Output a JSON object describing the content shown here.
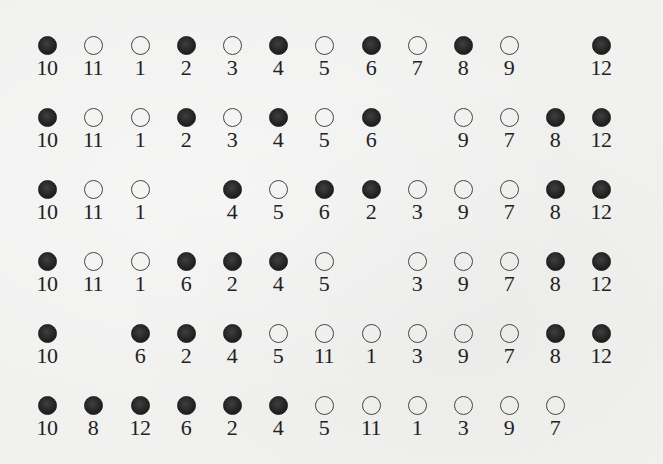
{
  "diagram": {
    "column_positions_px": [
      47,
      93,
      140,
      186,
      232,
      278,
      324,
      371,
      417,
      463,
      509,
      555,
      601
    ],
    "row_positions_px": [
      36,
      108,
      180,
      252,
      324,
      396
    ],
    "legend": {
      "filled": "dark filled circle",
      "open": "hollow circle"
    },
    "colors": {
      "background": "#f1f1f0",
      "filled_circle": "#2a2a2a",
      "open_circle_stroke": "#444444",
      "label_text": "#222222"
    },
    "rows": [
      {
        "items": [
          {
            "col": 0,
            "label": "10",
            "filled": true
          },
          {
            "col": 1,
            "label": "11",
            "filled": false
          },
          {
            "col": 2,
            "label": "1",
            "filled": false
          },
          {
            "col": 3,
            "label": "2",
            "filled": true
          },
          {
            "col": 4,
            "label": "3",
            "filled": false
          },
          {
            "col": 5,
            "label": "4",
            "filled": true
          },
          {
            "col": 6,
            "label": "5",
            "filled": false
          },
          {
            "col": 7,
            "label": "6",
            "filled": true
          },
          {
            "col": 8,
            "label": "7",
            "filled": false
          },
          {
            "col": 9,
            "label": "8",
            "filled": true
          },
          {
            "col": 10,
            "label": "9",
            "filled": false
          },
          {
            "col": 12,
            "label": "12",
            "filled": true
          }
        ]
      },
      {
        "items": [
          {
            "col": 0,
            "label": "10",
            "filled": true
          },
          {
            "col": 1,
            "label": "11",
            "filled": false
          },
          {
            "col": 2,
            "label": "1",
            "filled": false
          },
          {
            "col": 3,
            "label": "2",
            "filled": true
          },
          {
            "col": 4,
            "label": "3",
            "filled": false
          },
          {
            "col": 5,
            "label": "4",
            "filled": true
          },
          {
            "col": 6,
            "label": "5",
            "filled": false
          },
          {
            "col": 7,
            "label": "6",
            "filled": true
          },
          {
            "col": 9,
            "label": "9",
            "filled": false
          },
          {
            "col": 10,
            "label": "7",
            "filled": false
          },
          {
            "col": 11,
            "label": "8",
            "filled": true
          },
          {
            "col": 12,
            "label": "12",
            "filled": true
          }
        ]
      },
      {
        "items": [
          {
            "col": 0,
            "label": "10",
            "filled": true
          },
          {
            "col": 1,
            "label": "11",
            "filled": false
          },
          {
            "col": 2,
            "label": "1",
            "filled": false
          },
          {
            "col": 4,
            "label": "4",
            "filled": true
          },
          {
            "col": 5,
            "label": "5",
            "filled": false
          },
          {
            "col": 6,
            "label": "6",
            "filled": true
          },
          {
            "col": 7,
            "label": "2",
            "filled": true
          },
          {
            "col": 8,
            "label": "3",
            "filled": false
          },
          {
            "col": 9,
            "label": "9",
            "filled": false
          },
          {
            "col": 10,
            "label": "7",
            "filled": false
          },
          {
            "col": 11,
            "label": "8",
            "filled": true
          },
          {
            "col": 12,
            "label": "12",
            "filled": true
          }
        ]
      },
      {
        "items": [
          {
            "col": 0,
            "label": "10",
            "filled": true
          },
          {
            "col": 1,
            "label": "11",
            "filled": false
          },
          {
            "col": 2,
            "label": "1",
            "filled": false
          },
          {
            "col": 3,
            "label": "6",
            "filled": true
          },
          {
            "col": 4,
            "label": "2",
            "filled": true
          },
          {
            "col": 5,
            "label": "4",
            "filled": true
          },
          {
            "col": 6,
            "label": "5",
            "filled": false
          },
          {
            "col": 8,
            "label": "3",
            "filled": false
          },
          {
            "col": 9,
            "label": "9",
            "filled": false
          },
          {
            "col": 10,
            "label": "7",
            "filled": false
          },
          {
            "col": 11,
            "label": "8",
            "filled": true
          },
          {
            "col": 12,
            "label": "12",
            "filled": true
          }
        ]
      },
      {
        "items": [
          {
            "col": 0,
            "label": "10",
            "filled": true
          },
          {
            "col": 2,
            "label": "6",
            "filled": true
          },
          {
            "col": 3,
            "label": "2",
            "filled": true
          },
          {
            "col": 4,
            "label": "4",
            "filled": true
          },
          {
            "col": 5,
            "label": "5",
            "filled": false
          },
          {
            "col": 6,
            "label": "11",
            "filled": false
          },
          {
            "col": 7,
            "label": "1",
            "filled": false
          },
          {
            "col": 8,
            "label": "3",
            "filled": false
          },
          {
            "col": 9,
            "label": "9",
            "filled": false
          },
          {
            "col": 10,
            "label": "7",
            "filled": false
          },
          {
            "col": 11,
            "label": "8",
            "filled": true
          },
          {
            "col": 12,
            "label": "12",
            "filled": true
          }
        ]
      },
      {
        "items": [
          {
            "col": 0,
            "label": "10",
            "filled": true
          },
          {
            "col": 1,
            "label": "8",
            "filled": true
          },
          {
            "col": 2,
            "label": "12",
            "filled": true
          },
          {
            "col": 3,
            "label": "6",
            "filled": true
          },
          {
            "col": 4,
            "label": "2",
            "filled": true
          },
          {
            "col": 5,
            "label": "4",
            "filled": true
          },
          {
            "col": 6,
            "label": "5",
            "filled": false
          },
          {
            "col": 7,
            "label": "11",
            "filled": false
          },
          {
            "col": 8,
            "label": "1",
            "filled": false
          },
          {
            "col": 9,
            "label": "3",
            "filled": false
          },
          {
            "col": 10,
            "label": "9",
            "filled": false
          },
          {
            "col": 11,
            "label": "7",
            "filled": false
          }
        ]
      }
    ]
  }
}
